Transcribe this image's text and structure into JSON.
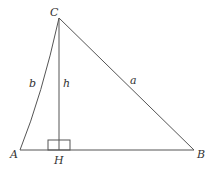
{
  "diagram": {
    "vertices": {
      "A": {
        "label": "A",
        "x": 20,
        "y": 150
      },
      "B": {
        "label": "B",
        "x": 194,
        "y": 150
      },
      "C": {
        "label": "C",
        "x": 59,
        "y": 18
      },
      "H": {
        "label": "H",
        "x": 59,
        "y": 150
      }
    },
    "sides": {
      "a": {
        "label": "a",
        "from": "C",
        "to": "B"
      },
      "b": {
        "label": "b",
        "from": "A",
        "to": "C"
      },
      "h": {
        "label": "h",
        "from": "C",
        "to": "H"
      }
    },
    "right_angle_marker": {
      "at": "H"
    },
    "colors": {
      "stroke": "#555555",
      "text": "#333333",
      "background": "#ffffff"
    }
  }
}
